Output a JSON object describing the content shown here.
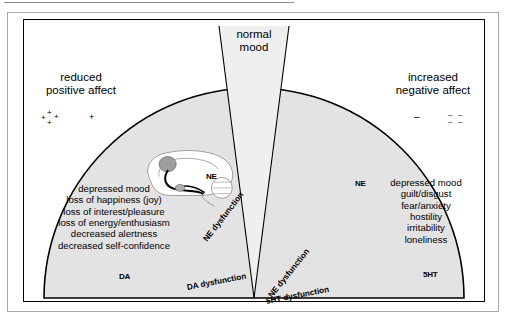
{
  "figure": {
    "title_region": "monoamine-dysfunction-semicircle",
    "top_label": {
      "line1": "normal",
      "line2": "mood"
    },
    "left_corner_label": {
      "line1": "reduced",
      "line2": "positive affect"
    },
    "right_corner_label": {
      "line1": "increased",
      "line2": "negative affect"
    },
    "left_symbol": {
      "from": "++++",
      "arrow": "→",
      "to": "+",
      "name": "positive-affect-reduction-symbol"
    },
    "right_symbol": {
      "from": "−",
      "arrow": "→",
      "to": "- - - -",
      "name": "negative-affect-increase-symbol"
    },
    "left_symptoms": [
      "depressed mood",
      "loss of happiness (joy)",
      "loss of interest/pleasure",
      "loss of energy/enthusiasm",
      "decreased alertness",
      "decreased self-confidence"
    ],
    "right_symptoms": [
      "depressed mood",
      "guilt/disgust",
      "fear/anxiety",
      "hostility",
      "irritability",
      "loneliness"
    ],
    "arrows": [
      {
        "label": "DA dysfunction",
        "direction": "lower-left",
        "head": "solid"
      },
      {
        "label": "NE dysfunction",
        "direction": "upper-left",
        "head": "solid"
      },
      {
        "label": "normal mood",
        "direction": "up",
        "head": "gray"
      },
      {
        "label": "NE dysfunction",
        "direction": "upper-right",
        "head": "solid"
      },
      {
        "label": "5HT dysfunction",
        "direction": "lower-right",
        "head": "hollow"
      }
    ],
    "brains": [
      {
        "tag": "NE",
        "position": "upper-left"
      },
      {
        "tag": "NE",
        "position": "upper-right"
      },
      {
        "tag": "DA",
        "position": "lower-left"
      },
      {
        "tag": "5HT",
        "position": "lower-right"
      }
    ],
    "colors": {
      "wedge_fill": "#e9e9e9",
      "dome_fill": "#e2e2e2",
      "outline": "#000000",
      "frame": "#a8a8a8",
      "brain_stroke": "#9a9a9a",
      "arrow_gray": "#6e6e6e"
    }
  }
}
